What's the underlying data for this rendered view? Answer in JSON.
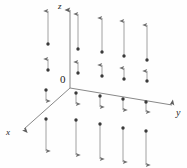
{
  "figure": {
    "width": 187,
    "height": 168,
    "background": "#fefefe"
  },
  "colors": {
    "axis": "#7a7a7a",
    "arrow": "#8a8a8a",
    "dot": "#3a3a3a",
    "text": "#1a1a1a"
  },
  "axes": {
    "origin": {
      "x": 70,
      "y": 88
    },
    "origin_label": "0",
    "items": [
      {
        "name": "z",
        "label": "z",
        "x1": 70,
        "y1": 88,
        "x2": 70,
        "y2": 10
      },
      {
        "name": "y",
        "label": "y",
        "x1": 70,
        "y1": 88,
        "x2": 172,
        "y2": 105
      },
      {
        "name": "x",
        "label": "x",
        "x1": 70,
        "y1": 88,
        "x2": 24,
        "y2": 129
      }
    ]
  },
  "chart_data": {
    "type": "scatter",
    "xlabel": "x",
    "ylabel": "y",
    "zlabel": "z",
    "arrows": [
      {
        "base_x": 48,
        "base_y": 44,
        "tip_x": 48,
        "tip_y": 11,
        "dir": "up",
        "length": 33
      },
      {
        "base_x": 48,
        "base_y": 70,
        "tip_x": 48,
        "tip_y": 59,
        "dir": "up",
        "length": 11
      },
      {
        "base_x": 78,
        "base_y": 49,
        "tip_x": 78,
        "tip_y": 14,
        "dir": "up",
        "length": 35
      },
      {
        "base_x": 78,
        "base_y": 73,
        "tip_x": 78,
        "tip_y": 62,
        "dir": "up",
        "length": 11
      },
      {
        "base_x": 102,
        "base_y": 52,
        "tip_x": 102,
        "tip_y": 18,
        "dir": "up",
        "length": 34
      },
      {
        "base_x": 102,
        "base_y": 76,
        "tip_x": 102,
        "tip_y": 65,
        "dir": "up",
        "length": 11
      },
      {
        "base_x": 124,
        "base_y": 56,
        "tip_x": 124,
        "tip_y": 21,
        "dir": "up",
        "length": 35
      },
      {
        "base_x": 124,
        "base_y": 79,
        "tip_x": 124,
        "tip_y": 68,
        "dir": "up",
        "length": 11
      },
      {
        "base_x": 147,
        "base_y": 60,
        "tip_x": 147,
        "tip_y": 25,
        "dir": "up",
        "length": 35
      },
      {
        "base_x": 147,
        "base_y": 81,
        "tip_x": 147,
        "tip_y": 71,
        "dir": "up",
        "length": 10
      },
      {
        "base_x": 46,
        "base_y": 90,
        "tip_x": 46,
        "tip_y": 101,
        "dir": "down",
        "length": 11
      },
      {
        "base_x": 46,
        "base_y": 119,
        "tip_x": 46,
        "tip_y": 151,
        "dir": "down",
        "length": 32
      },
      {
        "base_x": 76,
        "base_y": 93,
        "tip_x": 76,
        "tip_y": 104,
        "dir": "down",
        "length": 11
      },
      {
        "base_x": 76,
        "base_y": 120,
        "tip_x": 76,
        "tip_y": 155,
        "dir": "down",
        "length": 35
      },
      {
        "base_x": 100,
        "base_y": 96,
        "tip_x": 100,
        "tip_y": 107,
        "dir": "down",
        "length": 11
      },
      {
        "base_x": 100,
        "base_y": 124,
        "tip_x": 100,
        "tip_y": 159,
        "dir": "down",
        "length": 35
      },
      {
        "base_x": 123,
        "base_y": 99,
        "tip_x": 123,
        "tip_y": 110,
        "dir": "down",
        "length": 11
      },
      {
        "base_x": 123,
        "base_y": 128,
        "tip_x": 123,
        "tip_y": 162,
        "dir": "down",
        "length": 34
      },
      {
        "base_x": 146,
        "base_y": 102,
        "tip_x": 146,
        "tip_y": 112,
        "dir": "down",
        "length": 10
      },
      {
        "base_x": 146,
        "base_y": 131,
        "tip_x": 146,
        "tip_y": 165,
        "dir": "down",
        "length": 34
      }
    ]
  }
}
